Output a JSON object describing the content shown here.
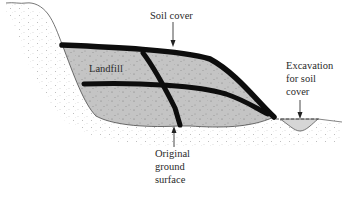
{
  "diagram": {
    "labels": {
      "soil_cover": "Soil cover",
      "landfill": "Landfill",
      "excavation_line1": "Excavation",
      "excavation_line2": "for soil",
      "excavation_line3": "cover",
      "original_line1": "Original",
      "original_line2": "ground",
      "original_line3": "surface"
    },
    "colors": {
      "landfill_fill": "#c4c4c4",
      "soil_cover_band": "#0d0d0d",
      "ground_stipple": "#b8b8b8",
      "excavation_fill": "#d6d6d6",
      "outline": "#555555"
    }
  }
}
